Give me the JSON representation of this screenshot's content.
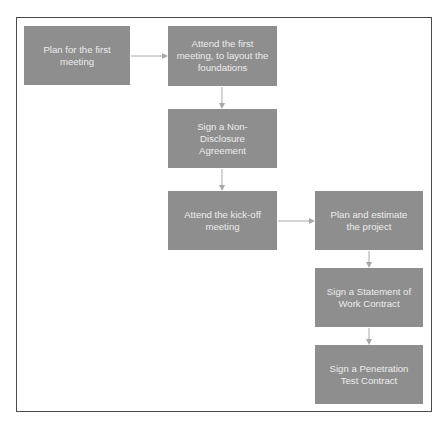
{
  "diagram": {
    "type": "flowchart",
    "colors": {
      "box_fill": "#8e8e8e",
      "box_text": "#ececec",
      "arrow": "#a8a8a8",
      "frame": "#4a4a4a",
      "background": "#ffffff"
    },
    "nodes": [
      {
        "id": "n1",
        "label": "Plan for the first meeting"
      },
      {
        "id": "n2",
        "label": "Attend the first meeting, to layout the foundations"
      },
      {
        "id": "n3",
        "label": "Sign a Non-Disclosure Agreement"
      },
      {
        "id": "n4",
        "label": "Attend the kick-off meeting"
      },
      {
        "id": "n5",
        "label": "Plan and estimate the project"
      },
      {
        "id": "n6",
        "label": "Sign a Statement of Work Contract"
      },
      {
        "id": "n7",
        "label": "Sign a Penetration Test Contract"
      }
    ],
    "edges": [
      {
        "from": "n1",
        "to": "n2",
        "direction": "right"
      },
      {
        "from": "n2",
        "to": "n3",
        "direction": "down"
      },
      {
        "from": "n3",
        "to": "n4",
        "direction": "down"
      },
      {
        "from": "n4",
        "to": "n5",
        "direction": "right"
      },
      {
        "from": "n5",
        "to": "n6",
        "direction": "down"
      },
      {
        "from": "n6",
        "to": "n7",
        "direction": "down"
      }
    ]
  }
}
